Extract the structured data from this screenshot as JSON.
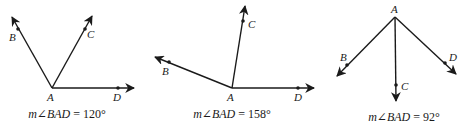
{
  "figures": [
    {
      "id": "fig1",
      "vertex": {
        "label": "A",
        "x": 52,
        "y": 88,
        "lx": 47,
        "ly": 101
      },
      "rays": [
        {
          "name": "B",
          "end": [
            12,
            17
          ],
          "point": [
            18,
            29
          ],
          "lx": 9,
          "ly": 41
        },
        {
          "name": "C",
          "end": [
            92,
            16
          ],
          "point": [
            85,
            29
          ],
          "lx": 87,
          "ly": 38
        },
        {
          "name": "D",
          "end": [
            134,
            88
          ],
          "point": [
            118,
            88
          ],
          "lx": 113,
          "ly": 101
        }
      ],
      "caption": {
        "prefix": "m",
        "angle_symbol": "∠",
        "angle": "BAD",
        "equals": " = ",
        "value": "120°",
        "x": 67,
        "y": 118
      }
    },
    {
      "id": "fig2",
      "vertex": {
        "label": "A",
        "x": 232,
        "y": 88,
        "lx": 227,
        "ly": 101
      },
      "rays": [
        {
          "name": "B",
          "end": [
            155,
            57
          ],
          "point": [
            169,
            62
          ],
          "lx": 162,
          "ly": 75
        },
        {
          "name": "C",
          "end": [
            245,
            6
          ],
          "point": [
            243,
            21
          ],
          "lx": 248,
          "ly": 28
        },
        {
          "name": "D",
          "end": [
            314,
            88
          ],
          "point": [
            298,
            88
          ],
          "lx": 294,
          "ly": 101
        }
      ],
      "caption": {
        "prefix": "m",
        "angle_symbol": "∠",
        "angle": "BAD",
        "equals": " = ",
        "value": "158°",
        "x": 232,
        "y": 118
      }
    },
    {
      "id": "fig3",
      "vertex": {
        "label": "A",
        "x": 395,
        "y": 17,
        "lx": 391,
        "ly": 13
      },
      "rays": [
        {
          "name": "B",
          "end": [
            337,
            76
          ],
          "point": [
            347,
            65
          ],
          "lx": 340,
          "ly": 61
        },
        {
          "name": "C",
          "end": [
            396,
            101
          ],
          "point": [
            396,
            85
          ],
          "lx": 401,
          "ly": 90
        },
        {
          "name": "D",
          "end": [
            456,
            74
          ],
          "point": [
            445,
            63
          ],
          "lx": 449,
          "ly": 61
        }
      ],
      "caption": {
        "prefix": "m",
        "angle_symbol": "∠",
        "angle": "BAD",
        "equals": " = ",
        "value": "92°",
        "x": 404,
        "y": 121
      }
    }
  ]
}
